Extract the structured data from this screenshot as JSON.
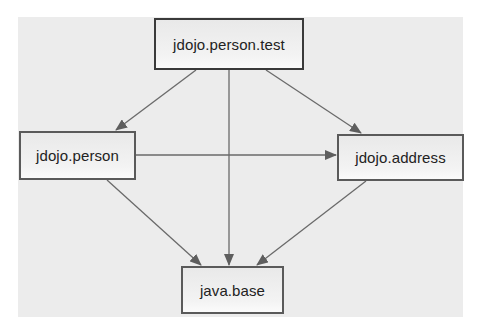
{
  "diagram": {
    "type": "module-dependency-graph",
    "nodes": [
      {
        "id": "person_test",
        "label": "jdojo.person.test",
        "x": 154,
        "y": 18,
        "w": 150,
        "h": 52
      },
      {
        "id": "person",
        "label": "jdojo.person",
        "x": 19,
        "y": 131,
        "w": 117,
        "h": 49
      },
      {
        "id": "address",
        "label": "jdojo.address",
        "x": 337,
        "y": 134,
        "w": 127,
        "h": 47
      },
      {
        "id": "java_base",
        "label": "java.base",
        "x": 181,
        "y": 266,
        "w": 103,
        "h": 48
      }
    ],
    "edges": [
      {
        "from": "jdojo.person.test",
        "to": "jdojo.person"
      },
      {
        "from": "jdojo.person.test",
        "to": "java.base"
      },
      {
        "from": "jdojo.person.test",
        "to": "jdojo.address"
      },
      {
        "from": "jdojo.person",
        "to": "jdojo.address"
      },
      {
        "from": "jdojo.person",
        "to": "java.base"
      },
      {
        "from": "jdojo.address",
        "to": "java.base"
      }
    ],
    "colors": {
      "background": "#ececec",
      "border": "#5a5a5a",
      "edge": "#6a6a6a",
      "text": "#222222"
    }
  }
}
